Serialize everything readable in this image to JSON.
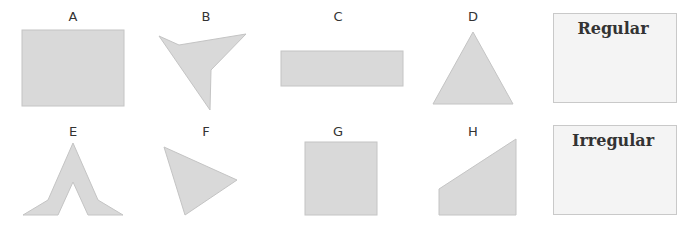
{
  "colors": {
    "shape_fill": "#d9d9d9",
    "shape_stroke": "#c4c4c4",
    "box_bg": "#f4f4f4",
    "box_border": "#c9c9c9",
    "text": "#333333"
  },
  "shapes": [
    {
      "label": "A",
      "type": "rectangle"
    },
    {
      "label": "B",
      "type": "irregular-concave-quadrilateral"
    },
    {
      "label": "C",
      "type": "rectangle"
    },
    {
      "label": "D",
      "type": "equilateral-triangle"
    },
    {
      "label": "E",
      "type": "irregular-chevron"
    },
    {
      "label": "F",
      "type": "triangle"
    },
    {
      "label": "G",
      "type": "square"
    },
    {
      "label": "H",
      "type": "trapezoid"
    }
  ],
  "sort_boxes": [
    {
      "title": "Regular"
    },
    {
      "title": "Irregular"
    }
  ]
}
